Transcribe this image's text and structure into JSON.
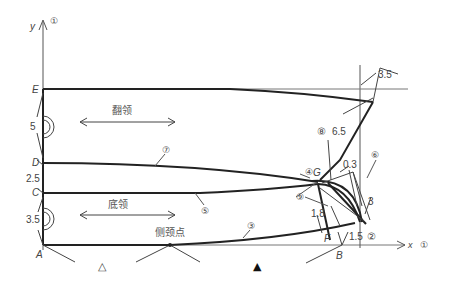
{
  "diagram": {
    "type": "collar pattern draft",
    "axes": {
      "y_label": "y",
      "y_marker": "①",
      "x_label": "x",
      "x_marker": "①"
    },
    "points": {
      "E": "E",
      "D": "D",
      "C": "C",
      "A": "A",
      "B": "B",
      "F": "F",
      "G": "G"
    },
    "dimensions": {
      "ED": "5",
      "DC": "2.5",
      "CA": "3.5",
      "top_right": "3.5",
      "vertical": "6.5",
      "g_offset": "0.3",
      "corner": "3",
      "f_offset": "1.8",
      "fb": "1.5"
    },
    "markers": {
      "m2": "②",
      "m3": "③",
      "m4": "④",
      "m5": "⑤",
      "m6": "⑥",
      "m7": "⑦",
      "m8": "⑧",
      "m9": "⑨"
    },
    "regions": {
      "upper_collar": "翻领",
      "lower_collar": "底领",
      "side_neck_point": "侧颈点"
    },
    "symbols": {
      "open_triangle": "△",
      "filled_triangle": "▲"
    }
  }
}
